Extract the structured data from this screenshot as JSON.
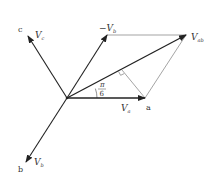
{
  "diagram": {
    "colors": {
      "background": "#ffffff",
      "stroke_heavy": "#222222",
      "stroke_light": "#555555",
      "text": "#333333"
    },
    "labels": {
      "point_c": "c",
      "point_a": "a",
      "point_b": "b",
      "Vc": {
        "main": "V",
        "sub": "c"
      },
      "Vb": {
        "main": "V",
        "sub": "b"
      },
      "Va": {
        "main": "V",
        "sub": "a"
      },
      "negVb": {
        "prefix": "−",
        "main": "V",
        "sub": "b"
      },
      "Vab": {
        "main": "V",
        "sub": "ab"
      },
      "angle_num": "π",
      "angle_den": "6"
    },
    "geometry": {
      "origin": [
        67,
        98
      ],
      "Va_tip": [
        145,
        98
      ],
      "negVb_tip": [
        107,
        35
      ],
      "Vab_tip": [
        186,
        35
      ],
      "Vc_tip": [
        28,
        36
      ],
      "Vb_tip": [
        26,
        162
      ],
      "perp_foot": [
        122,
        70
      ]
    }
  }
}
